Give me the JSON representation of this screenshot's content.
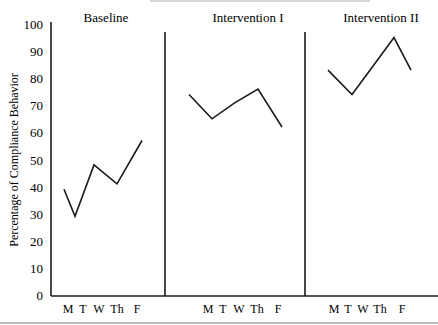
{
  "chart_data": {
    "type": "line",
    "title": "",
    "xlabel": "",
    "ylabel": "Percentage of Compliance Behavior",
    "ylim": [
      0,
      100
    ],
    "yticks": [
      0,
      10,
      20,
      30,
      40,
      50,
      60,
      70,
      80,
      90,
      100
    ],
    "grid": false,
    "legend": null,
    "categories": [
      "M",
      "T",
      "W",
      "Th",
      "F"
    ],
    "phases": [
      {
        "name": "Baseline",
        "x": [
          "M",
          "T",
          "W",
          "Th",
          "F"
        ],
        "values": [
          39,
          29,
          48,
          41,
          57
        ]
      },
      {
        "name": "Intervention I",
        "x": [
          "M",
          "T",
          "W",
          "Th",
          "F"
        ],
        "values": [
          74,
          65,
          71,
          76,
          62
        ]
      },
      {
        "name": "Intervention II",
        "x": [
          "M",
          "T",
          "W",
          "Th",
          "F"
        ],
        "values": [
          83,
          74,
          84,
          95,
          83
        ]
      }
    ]
  },
  "labels": {
    "ylabel": "Percentage of Compliance Behavior",
    "phase_titles": [
      "Baseline",
      "Intervention I",
      "Intervention II"
    ],
    "yticks": [
      "0",
      "10",
      "20",
      "30",
      "40",
      "50",
      "60",
      "70",
      "80",
      "90",
      "100"
    ],
    "xticks": [
      "M",
      "T",
      "W",
      "Th",
      "F"
    ]
  }
}
